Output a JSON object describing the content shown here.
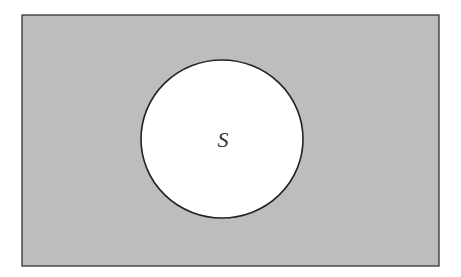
{
  "diagram": {
    "type": "venn",
    "universe": {
      "fill": "#bdbdbd",
      "stroke": "#333333",
      "x": 22,
      "y": 15,
      "width": 417,
      "height": 251
    },
    "sets": [
      {
        "label": "S",
        "fill": "#ffffff",
        "stroke": "#222222",
        "cx": 222,
        "cy": 139,
        "rx": 81,
        "ry": 79
      }
    ],
    "shaded_region": "complement of S"
  }
}
